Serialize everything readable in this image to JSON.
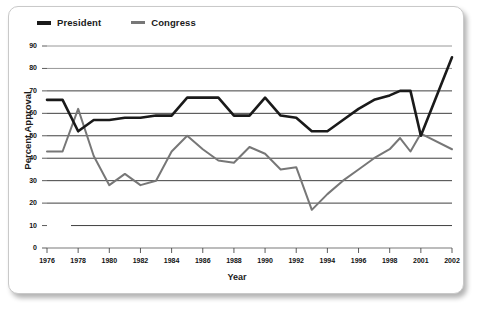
{
  "chart_data": {
    "type": "line",
    "title": "",
    "xlabel": "Year",
    "ylabel": "Percent Approval",
    "xlim": [
      1976,
      2002
    ],
    "ylim": [
      0,
      90
    ],
    "grid": true,
    "legend_position": "top-left",
    "ytick_labels": [
      "0",
      "10",
      "20",
      "30",
      "40",
      "50",
      "60",
      "70",
      "80",
      "90"
    ],
    "ytick_values": [
      0,
      10,
      20,
      30,
      40,
      50,
      60,
      70,
      80,
      90
    ],
    "xtick_labels": [
      "1976",
      "1978",
      "1980",
      "1982",
      "1984",
      "1986",
      "1988",
      "1990",
      "1992",
      "1994",
      "1996",
      "1998",
      "2001",
      "2002"
    ],
    "xtick_values": [
      1976,
      1978,
      1980,
      1982,
      1984,
      1986,
      1988,
      1990,
      1992,
      1994,
      1996,
      1998,
      2001,
      2002
    ],
    "x": [
      1976,
      1977,
      1978,
      1979,
      1980,
      1981,
      1982,
      1983,
      1984,
      1985,
      1986,
      1987,
      1988,
      1989,
      1990,
      1991,
      1992,
      1993,
      1994,
      1995,
      1996,
      1997,
      1998,
      1999,
      2000,
      2001,
      2002
    ],
    "series": [
      {
        "name": "President",
        "color": "#1a1a1a",
        "values": [
          66,
          66,
          52,
          57,
          57,
          58,
          58,
          59,
          59,
          67,
          67,
          67,
          59,
          59,
          67,
          59,
          58,
          52,
          52,
          57,
          62,
          66,
          68,
          70,
          70,
          50,
          85
        ]
      },
      {
        "name": "Congress",
        "color": "#777777",
        "values": [
          43,
          43,
          62,
          41,
          28,
          33,
          28,
          30,
          43,
          50,
          44,
          39,
          38,
          45,
          42,
          35,
          36,
          17,
          24,
          30,
          35,
          40,
          44,
          49,
          43,
          51,
          44
        ]
      }
    ]
  },
  "legend": {
    "items": [
      {
        "label": "President",
        "color": "#1a1a1a"
      },
      {
        "label": "Congress",
        "color": "#777777"
      }
    ]
  }
}
